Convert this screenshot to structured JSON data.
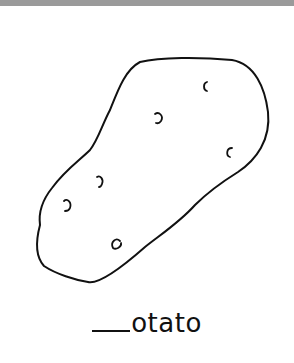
{
  "worksheet": {
    "picture": "potato",
    "word_with_blank": {
      "blank": "____",
      "rest": "otato"
    }
  },
  "colors": {
    "line": "#111111",
    "top_bar": "#9a9a9a",
    "background": "#ffffff"
  }
}
